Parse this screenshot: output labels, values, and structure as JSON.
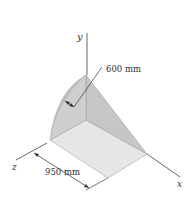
{
  "diagram": {
    "type": "3d-solid-quarter-cylinder-wedge",
    "axes": {
      "x_label": "x",
      "y_label": "y",
      "z_label": "z"
    },
    "dimensions": {
      "radius_label": "600 mm",
      "length_label": "950 mm"
    },
    "colors": {
      "curved_face": "#c9c9c9",
      "side_face": "#b8b8b8",
      "slanted_face": "#d8d8d8",
      "bottom_face": "#e4e4e4",
      "line": "#444444"
    }
  }
}
